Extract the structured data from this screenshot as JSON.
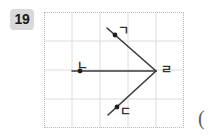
{
  "badge": {
    "number": "19"
  },
  "figure": {
    "grid": {
      "cols": 5,
      "rows": 4,
      "cell_width": 28,
      "cell_height": 29,
      "line_color": "#dcdcdc",
      "border_style": "dotted",
      "border_color": "#b8b8b8"
    },
    "stroke_color": "#3a3a3a",
    "point_color": "#1f1f1f",
    "vertex": {
      "label": "ㄹ",
      "x": 112,
      "y": 59
    },
    "rays": [
      {
        "name": "upper-ray",
        "label": "ㄱ",
        "from": {
          "x": 112,
          "y": 59
        },
        "to": {
          "x": 63,
          "y": 16
        },
        "point": {
          "x": 71,
          "y": 23
        }
      },
      {
        "name": "left-ray",
        "label": "ㄴ",
        "from": {
          "x": 112,
          "y": 59
        },
        "to": {
          "x": 28,
          "y": 59
        },
        "point": {
          "x": 36,
          "y": 59
        }
      },
      {
        "name": "lower-ray",
        "label": "ㄷ",
        "from": {
          "x": 112,
          "y": 59
        },
        "to": {
          "x": 64,
          "y": 103
        },
        "point": {
          "x": 73,
          "y": 95
        }
      }
    ],
    "labels": {
      "upper": "ㄱ",
      "left": "ㄴ",
      "lower": "ㄷ",
      "vertex": "ㄹ"
    }
  },
  "trailing": {
    "paren": "("
  },
  "colors": {
    "badge_bg": "#d9d9d9",
    "badge_text": "#1a1a1a",
    "stroke": "#3a3a3a",
    "grid": "#dcdcdc",
    "page_bg": "#ffffff"
  }
}
